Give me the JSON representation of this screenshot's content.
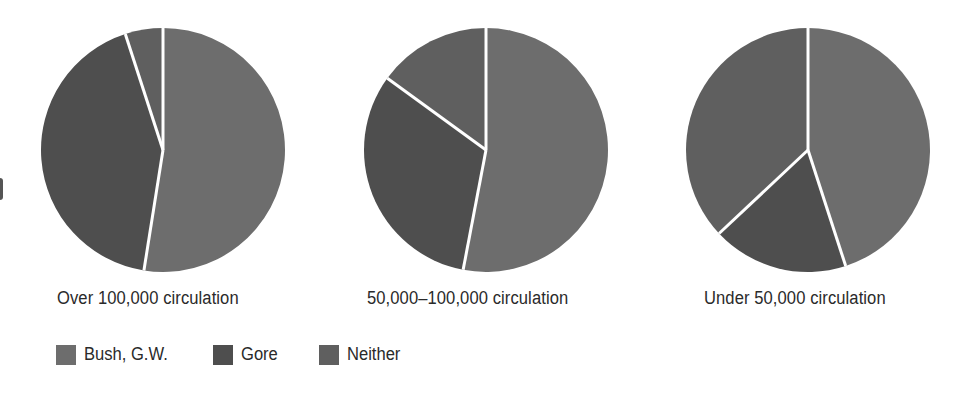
{
  "chart_data": {
    "type": "pie",
    "title": "",
    "legend": {
      "position": "bottom-left",
      "entries": [
        {
          "name": "Bush, G.W.",
          "color": "#6d6d6d"
        },
        {
          "name": "Gore",
          "color": "#4e4e4e"
        },
        {
          "name": "Neither",
          "color": "#5f5f5f"
        }
      ]
    },
    "charts": [
      {
        "label": "Over 100,000 circulation",
        "slices": [
          {
            "name": "Bush, G.W.",
            "value": 52.5
          },
          {
            "name": "Gore",
            "value": 42.5
          },
          {
            "name": "Neither",
            "value": 5
          }
        ]
      },
      {
        "label": "50,000–100,000 circulation",
        "slices": [
          {
            "name": "Bush, G.W.",
            "value": 53
          },
          {
            "name": "Gore",
            "value": 32
          },
          {
            "name": "Neither",
            "value": 15
          }
        ]
      },
      {
        "label": "Under 50,000 circulation",
        "slices": [
          {
            "name": "Bush, G.W.",
            "value": 45
          },
          {
            "name": "Gore",
            "value": 18
          },
          {
            "name": "Neither",
            "value": 37
          }
        ]
      }
    ]
  },
  "labels": {
    "pie1": "Over 100,000 circulation",
    "pie2": "50,000–100,000 circulation",
    "pie3": "Under 50,000 circulation"
  },
  "legend": {
    "bush": "Bush, G.W.",
    "gore": "Gore",
    "neither": "Neither"
  }
}
